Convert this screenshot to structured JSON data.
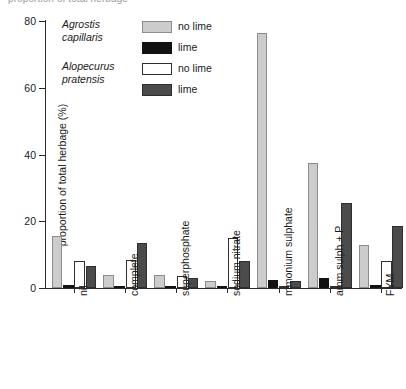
{
  "clipped_caption": "proportion of total herbage",
  "legend": {
    "groups": [
      {
        "species": "Agrostis capillaris",
        "species_line1": "Agrostis",
        "species_line2": "capillaris",
        "entries": [
          {
            "label": "no lime",
            "swatch": "light-gray",
            "color": "#cccccc"
          },
          {
            "label": "lime",
            "swatch": "black",
            "color": "#121212"
          }
        ]
      },
      {
        "species": "Alopecurus pratensis",
        "species_line1": "Alopecurus",
        "species_line2": "pratensis",
        "entries": [
          {
            "label": "no lime",
            "swatch": "white",
            "color": "#ffffff"
          },
          {
            "label": "lime",
            "swatch": "dark-gray",
            "color": "#4b4b4b"
          }
        ]
      }
    ]
  },
  "axes": {
    "y_title": "proportion of total herbage (%)",
    "y_ticks": [
      "0",
      "20",
      "40",
      "60",
      "80"
    ],
    "x_labels": [
      "nil",
      "complete",
      "superphosphate",
      "sodium nitrate",
      "mmonium sulphate",
      "amm sulph + P",
      "FYM"
    ]
  },
  "chart_data": {
    "type": "bar",
    "title": "",
    "xlabel": "",
    "ylabel": "proportion of total herbage (%)",
    "ylim": [
      0,
      80
    ],
    "yticks": [
      0,
      20,
      40,
      60,
      80
    ],
    "grid": false,
    "legend_position": "top-left-inside",
    "categories": [
      "nil",
      "complete",
      "superphosphate",
      "sodium nitrate",
      "mmonium sulphate",
      "amm sulph + P",
      "FYM"
    ],
    "series": [
      {
        "name": "Agrostis capillaris no lime",
        "species": "Agrostis capillaris",
        "lime": "no lime",
        "color": "#cccccc",
        "values": [
          15.5,
          4.0,
          4.0,
          2.0,
          76.5,
          37.5,
          13.0
        ]
      },
      {
        "name": "Agrostis capillaris lime",
        "species": "Agrostis capillaris",
        "lime": "lime",
        "color": "#121212",
        "values": [
          0.8,
          0.6,
          0.5,
          0.5,
          2.5,
          3.0,
          1.0
        ]
      },
      {
        "name": "Alopecurus pratensis no lime",
        "species": "Alopecurus pratensis",
        "lime": "no lime",
        "color": "#ffffff",
        "values": [
          8.0,
          8.5,
          3.5,
          15.0,
          0.6,
          0.5,
          8.0
        ]
      },
      {
        "name": "Alopecurus pratensis lime",
        "species": "Alopecurus pratensis",
        "lime": "lime",
        "color": "#4b4b4b",
        "values": [
          6.5,
          13.5,
          3.0,
          8.0,
          2.2,
          25.5,
          18.5
        ]
      }
    ]
  }
}
